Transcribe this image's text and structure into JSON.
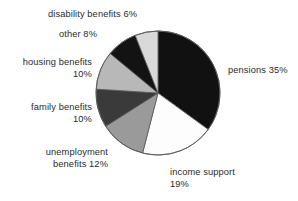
{
  "chart_data": {
    "type": "pie",
    "title": "",
    "subtitle": "",
    "xlabel": "",
    "ylabel": "",
    "legend_position": "none",
    "grid": false,
    "start_angle_deg": 0,
    "direction": "clockwise",
    "categories": [
      "pensions",
      "income support",
      "unemployment benefits",
      "family benefits",
      "housing benefits",
      "other",
      "disability benefits"
    ],
    "values": [
      35,
      19,
      12,
      10,
      10,
      8,
      6
    ],
    "unit": "%",
    "slices": [
      {
        "name": "pensions",
        "value": 35,
        "label": "pensions 35%",
        "color": "#111111",
        "start_deg": 0,
        "end_deg": 126
      },
      {
        "name": "income support",
        "value": 19,
        "label": "income support\n19%",
        "color": "#fdfdfd",
        "start_deg": 126,
        "end_deg": 194.4
      },
      {
        "name": "unemployment benefits",
        "value": 12,
        "label": "unemployment\nbenefits 12%",
        "color": "#9a9a9a",
        "start_deg": 194.4,
        "end_deg": 237.6
      },
      {
        "name": "family benefits",
        "value": 10,
        "label": "family benefits\n10%",
        "color": "#3a3a3a",
        "start_deg": 237.6,
        "end_deg": 273.6
      },
      {
        "name": "housing benefits",
        "value": 10,
        "label": "housing benefits\n10%",
        "color": "#b8b8b8",
        "start_deg": 273.6,
        "end_deg": 309.6
      },
      {
        "name": "other",
        "value": 8,
        "label": "other 8%",
        "color": "#131313",
        "start_deg": 309.6,
        "end_deg": 338.4
      },
      {
        "name": "disability benefits",
        "value": 6,
        "label": "disability benefits 6%",
        "color": "#d9d9d9",
        "start_deg": 338.4,
        "end_deg": 360
      }
    ],
    "geometry": {
      "center_x": 158,
      "center_y": 93,
      "radius": 62
    },
    "outline_color": "#555555",
    "background": "#ffffff",
    "text_color": "#2b2b2b"
  },
  "labels": {
    "pensions": "pensions 35%",
    "income_support": "income support\n19%",
    "unemployment": "unemployment\nbenefits 12%",
    "family": "family benefits\n10%",
    "housing": "housing benefits\n10%",
    "other": "other 8%",
    "disability": "disability benefits 6%"
  }
}
